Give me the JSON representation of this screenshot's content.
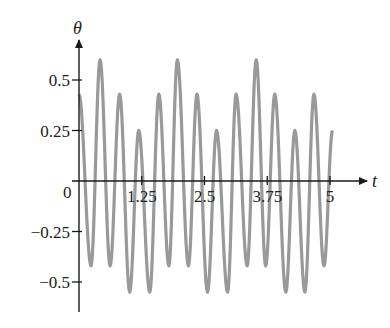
{
  "chart_data": {
    "type": "line",
    "title": "",
    "xlabel": "t",
    "ylabel": "θ",
    "origin_label": "0",
    "xlim": [
      0,
      5.2
    ],
    "ylim": [
      -0.65,
      0.7
    ],
    "grid": false,
    "legend": null,
    "x_ticks": [
      {
        "value": 1.25,
        "label": "1.25"
      },
      {
        "value": 2.5,
        "label": "2.5"
      },
      {
        "value": 3.75,
        "label": "3.75"
      },
      {
        "value": 5,
        "label": "5"
      }
    ],
    "y_ticks": [
      {
        "value": 0.5,
        "label": "0.5"
      },
      {
        "value": 0.25,
        "label": "0.25"
      },
      {
        "value": -0.25,
        "label": "−0.25"
      },
      {
        "value": -0.5,
        "label": "−0.5"
      }
    ],
    "series": [
      {
        "name": "θ(t)",
        "color": "#999999",
        "t_range": [
          0,
          5.05
        ],
        "model": {
          "comment": "approximate oscillation: fast carrier with slow modulation",
          "fast_amplitude": 0.42,
          "fast_period": 0.39,
          "slow_amplitude": 0.17,
          "slow_period": 1.55,
          "fast_phase_t": 0.0,
          "slow_phase_t": 0.4
        },
        "peaks": [
          {
            "t": 0.02,
            "theta": 0.43
          },
          {
            "t": 0.42,
            "theta": 0.6
          },
          {
            "t": 0.81,
            "theta": 0.43
          },
          {
            "t": 1.19,
            "theta": 0.25
          },
          {
            "t": 1.59,
            "theta": 0.43
          },
          {
            "t": 1.96,
            "theta": 0.6
          },
          {
            "t": 2.35,
            "theta": 0.43
          },
          {
            "t": 2.74,
            "theta": 0.25
          },
          {
            "t": 3.13,
            "theta": 0.43
          },
          {
            "t": 3.53,
            "theta": 0.6
          },
          {
            "t": 3.9,
            "theta": 0.43
          },
          {
            "t": 4.3,
            "theta": 0.25
          },
          {
            "t": 4.68,
            "theta": 0.43
          }
        ],
        "troughs": [
          {
            "t": 0.24,
            "theta": -0.42
          },
          {
            "t": 0.62,
            "theta": -0.42
          },
          {
            "t": 1.01,
            "theta": -0.55
          },
          {
            "t": 1.41,
            "theta": -0.55
          },
          {
            "t": 1.79,
            "theta": -0.42
          },
          {
            "t": 2.18,
            "theta": -0.42
          },
          {
            "t": 2.56,
            "theta": -0.55
          },
          {
            "t": 2.96,
            "theta": -0.55
          },
          {
            "t": 3.35,
            "theta": -0.42
          },
          {
            "t": 3.72,
            "theta": -0.42
          },
          {
            "t": 4.12,
            "theta": -0.55
          },
          {
            "t": 4.5,
            "theta": -0.55
          },
          {
            "t": 4.88,
            "theta": -0.42
          }
        ],
        "end_point": {
          "t": 5.05,
          "theta": 0.25
        }
      }
    ]
  },
  "layout": {
    "origin_px": [
      79,
      181
    ],
    "px_per_t": 50.2,
    "px_per_theta": 202,
    "axis_color": "#1a1a1a",
    "curve_color": "#999999"
  }
}
